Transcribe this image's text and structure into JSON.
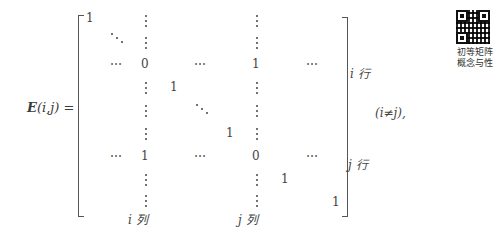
{
  "formula": {
    "lhs": {
      "symbol": "E",
      "args": "(i,j)",
      "equals": "="
    },
    "condition": "(i≠j),",
    "row_labels": {
      "i_row": "i 行",
      "j_row": "j 行"
    },
    "col_labels": {
      "i_col": "i 列",
      "j_col": "j 列"
    },
    "cells": {
      "r1c1": "1",
      "r3_i_col": "0",
      "r3_j_col": "1",
      "r4_diag": "1",
      "r6_diag": "1",
      "r7_i_col": "1",
      "r7_j_col": "0",
      "r8_diag": "1",
      "last": "1",
      "hdots": "⋯"
    }
  },
  "qr": {
    "caption_line1": "初等矩阵",
    "caption_line2": "概念与性"
  }
}
